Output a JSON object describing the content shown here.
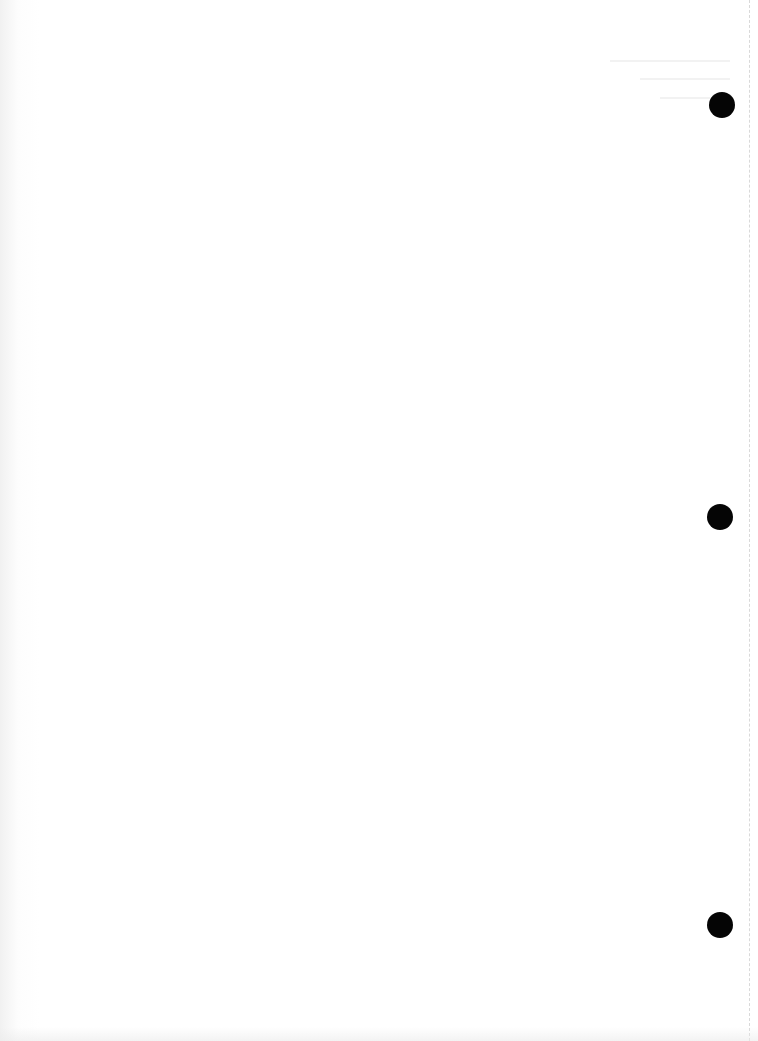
{
  "document": {
    "type": "blank scanned page",
    "background_color": "#ffffff",
    "text": "",
    "punch_holes": [
      {
        "x": 722,
        "y": 105
      },
      {
        "x": 720,
        "y": 517
      },
      {
        "x": 720,
        "y": 925
      }
    ],
    "hole_color": "#050505",
    "edge_line_color": "#d9d9d9"
  }
}
